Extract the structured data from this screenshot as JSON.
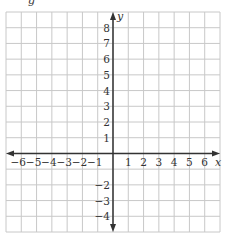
{
  "chart_data": {
    "type": "coordinate-grid",
    "title": "",
    "xlabel": "x",
    "ylabel": "y",
    "xlim": [
      -7,
      7
    ],
    "ylim": [
      -5,
      9
    ],
    "grid": true,
    "x_tick_labels": [
      "−6",
      "−5",
      "−4",
      "−3",
      "−2",
      "−1",
      "1",
      "2",
      "3",
      "4",
      "5",
      "6"
    ],
    "x_ticks": [
      -6,
      -5,
      -4,
      -3,
      -2,
      -1,
      1,
      2,
      3,
      4,
      5,
      6
    ],
    "y_tick_labels": [
      "8",
      "7",
      "6",
      "5",
      "4",
      "3",
      "2",
      "1",
      "−2",
      "−3",
      "−4"
    ],
    "y_ticks": [
      8,
      7,
      6,
      5,
      4,
      3,
      2,
      1,
      -2,
      -3,
      -4
    ],
    "series": [],
    "colors": {
      "grid": "#c8c8c8",
      "axis": "#333333",
      "text": "#333333"
    }
  },
  "header": {
    "cropped_label": "g"
  }
}
